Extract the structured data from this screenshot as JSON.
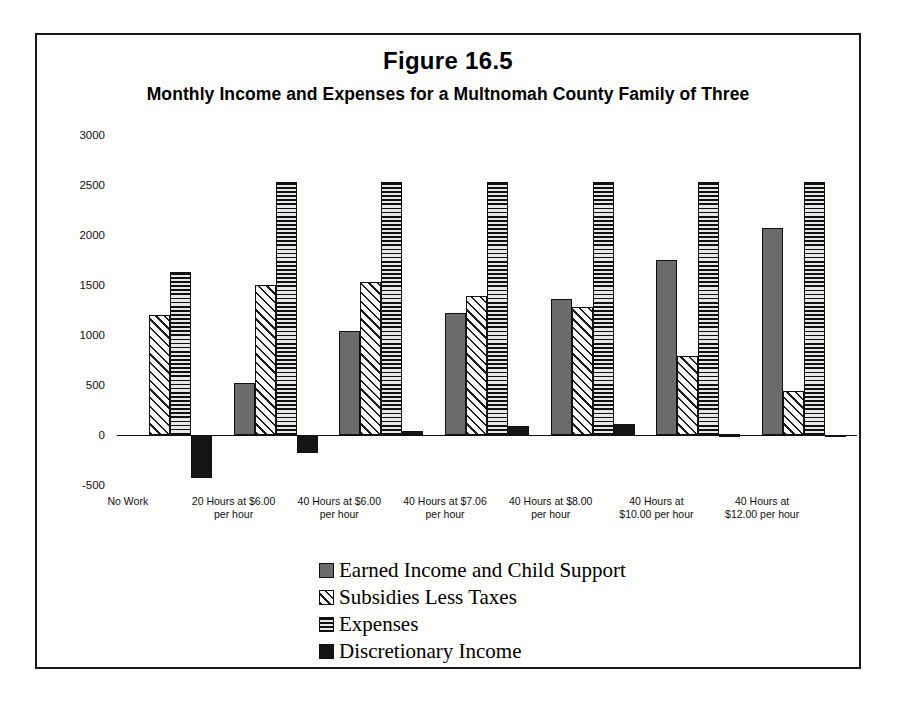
{
  "figure": {
    "title": "Figure 16.5",
    "subtitle": "Monthly Income and Expenses for a Multnomah County Family of Three"
  },
  "legend": {
    "items": [
      {
        "label": "Earned Income and Child Support",
        "swatch": "solid-gray",
        "color": "#6b6b6b"
      },
      {
        "label": "Subsidies Less Taxes",
        "swatch": "diagonal-hatch",
        "color": "#1d1d1d"
      },
      {
        "label": "Expenses",
        "swatch": "horizontal-hatch",
        "color": "#101010"
      },
      {
        "label": "Discretionary Income",
        "swatch": "solid-black",
        "color": "#151515"
      }
    ]
  },
  "axis": {
    "y_ticks": [
      "3000",
      "2500",
      "2000",
      "1500",
      "1000",
      "500",
      "0",
      "-500"
    ],
    "y_tick_values": [
      3000,
      2500,
      2000,
      1500,
      1000,
      500,
      0,
      -500
    ]
  },
  "chart_data": {
    "type": "bar",
    "title": "Monthly Income and Expenses for a Multnomah County Family of Three",
    "xlabel": "",
    "ylabel": "",
    "ylim": [
      -500,
      3000
    ],
    "grid": false,
    "legend_position": "bottom-center",
    "categories": [
      "No Work",
      "20 Hours at $6.00 per hour",
      "40 Hours at $6.00 per hour",
      "40 Hours at $7.06 per hour",
      "40 Hours at $8.00 per hour",
      "40 Hours at $10.00 per hour",
      "40 Hours at $12.00 per hour"
    ],
    "category_lines": [
      [
        "No Work"
      ],
      [
        "20 Hours at $6.00",
        "per hour"
      ],
      [
        "40 Hours at $6.00",
        "per hour"
      ],
      [
        "40 Hours at $7.06",
        "per hour"
      ],
      [
        "40 Hours at $8.00",
        "per hour"
      ],
      [
        "40 Hours at",
        "$10.00 per hour"
      ],
      [
        "40 Hours at",
        "$12.00 per hour"
      ]
    ],
    "series": [
      {
        "name": "Earned Income and Child Support",
        "values": [
          0,
          520,
          1040,
          1220,
          1360,
          1750,
          2070
        ]
      },
      {
        "name": "Subsidies Less Taxes",
        "values": [
          1200,
          1500,
          1530,
          1390,
          1280,
          790,
          440
        ]
      },
      {
        "name": "Expenses",
        "values": [
          1630,
          2530,
          2530,
          2530,
          2530,
          2530,
          2530
        ]
      },
      {
        "name": "Discretionary Income",
        "values": [
          -430,
          -180,
          40,
          90,
          110,
          10,
          -20
        ]
      }
    ]
  }
}
